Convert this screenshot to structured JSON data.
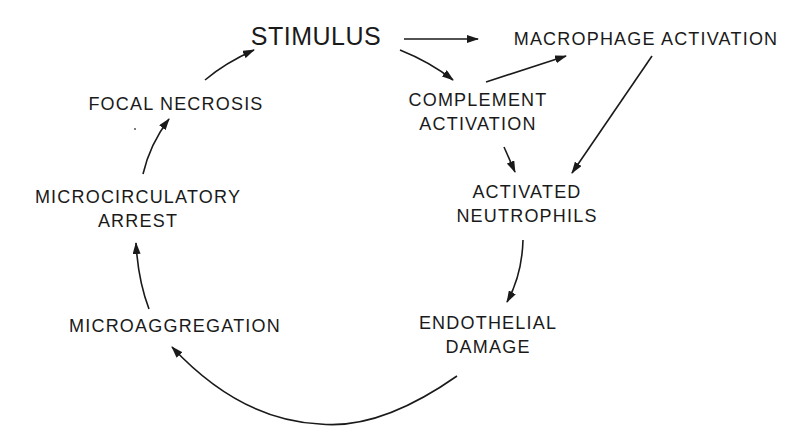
{
  "diagram": {
    "type": "cycle-flow",
    "nodes": {
      "stimulus": {
        "lines": [
          "STIMULUS"
        ]
      },
      "macrophage": {
        "lines": [
          "MACROPHAGE ACTIVATION"
        ]
      },
      "complement": {
        "lines": [
          "COMPLEMENT",
          "ACTIVATION"
        ]
      },
      "neutrophils": {
        "lines": [
          "ACTIVATED",
          "NEUTROPHILS"
        ]
      },
      "endothelial": {
        "lines": [
          "ENDOTHELIAL",
          "DAMAGE"
        ]
      },
      "microaggregation": {
        "lines": [
          "MICROAGGREGATION"
        ]
      },
      "microcirculatory": {
        "lines": [
          "MICROCIRCULATORY",
          "ARREST"
        ]
      },
      "necrosis": {
        "lines": [
          "FOCAL NECROSIS"
        ]
      }
    },
    "edges": [
      {
        "from": "stimulus",
        "to": "macrophage"
      },
      {
        "from": "stimulus",
        "to": "complement"
      },
      {
        "from": "complement",
        "to": "macrophage"
      },
      {
        "from": "complement",
        "to": "neutrophils"
      },
      {
        "from": "macrophage",
        "to": "neutrophils"
      },
      {
        "from": "neutrophils",
        "to": "endothelial"
      },
      {
        "from": "endothelial",
        "to": "microaggregation"
      },
      {
        "from": "microaggregation",
        "to": "microcirculatory"
      },
      {
        "from": "microcirculatory",
        "to": "necrosis"
      },
      {
        "from": "necrosis",
        "to": "stimulus"
      }
    ]
  }
}
